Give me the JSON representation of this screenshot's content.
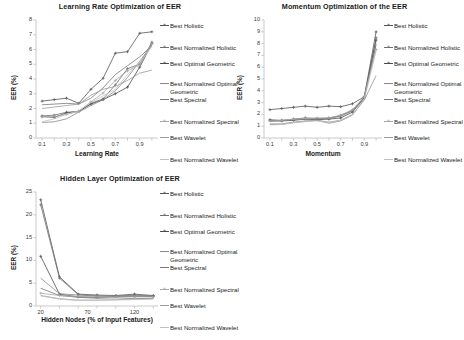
{
  "figure": {
    "background": "#ffffff",
    "series_names": [
      "Best Holistic",
      "Best Normalized Holistic",
      "Best Optimal Geometric",
      "Best Normalized Optimal Geometric",
      "Best Spectral",
      "Best Normalized Spectral",
      "Best Wavelet",
      "Best Normalized Wavelet"
    ],
    "series_colors": [
      "#555555",
      "#6e6e6e",
      "#4a4a4a",
      "#8a8a8a",
      "#777777",
      "#a8a8a8",
      "#9a9a9a",
      "#c0c0c0"
    ],
    "legend_marker_types": [
      "plus",
      "plus",
      "plus",
      "line",
      "line",
      "plus",
      "line",
      "line"
    ]
  },
  "chart_data": [
    {
      "id": "learning-rate",
      "type": "line",
      "title": "Learning Rate Optimization of EER",
      "xlabel": "Learning Rate",
      "ylabel": "EER (%)",
      "x": [
        0.1,
        0.2,
        0.3,
        0.4,
        0.5,
        0.6,
        0.7,
        0.8,
        0.9,
        1.0
      ],
      "xticks": [
        "0.1",
        "0.3",
        "0.5",
        "0.7",
        "0.9"
      ],
      "xtick_values": [
        0.1,
        0.3,
        0.5,
        0.7,
        0.9
      ],
      "yticks": [
        "0",
        "1",
        "2",
        "3",
        "4",
        "5",
        "6",
        "7",
        "8"
      ],
      "ylim": [
        0,
        8
      ],
      "xlim": [
        0.05,
        1.05
      ],
      "grid": false,
      "legend_position": "right",
      "series": [
        {
          "name": "Best Holistic",
          "values": [
            2.5,
            2.6,
            2.7,
            2.35,
            3.3,
            4.05,
            5.75,
            5.85,
            7.1,
            7.2
          ]
        },
        {
          "name": "Best Normalized Holistic",
          "values": [
            1.5,
            1.55,
            1.75,
            1.8,
            2.35,
            2.65,
            3.6,
            4.7,
            5.0,
            6.5
          ]
        },
        {
          "name": "Best Optimal Geometric",
          "values": [
            1.45,
            1.4,
            1.7,
            1.8,
            2.3,
            2.6,
            3.0,
            3.45,
            4.8,
            6.4
          ]
        },
        {
          "name": "Best Normalized Optimal Geometric",
          "values": [
            1.05,
            1.1,
            1.3,
            1.75,
            2.2,
            2.6,
            3.2,
            4.1,
            5.2,
            6.3
          ]
        },
        {
          "name": "Best Spectral",
          "values": [
            2.25,
            2.3,
            2.35,
            2.3,
            2.7,
            3.4,
            4.3,
            4.9,
            5.5,
            6.25
          ]
        },
        {
          "name": "Best Normalized Spectral",
          "values": [
            1.45,
            1.45,
            1.6,
            1.8,
            2.45,
            3.05,
            3.9,
            4.55,
            4.95,
            6.4
          ]
        },
        {
          "name": "Best Wavelet",
          "values": [
            2.0,
            2.1,
            2.2,
            2.3,
            2.9,
            3.3,
            3.5,
            3.9,
            4.4,
            4.6
          ]
        },
        {
          "name": "Best Normalized Wavelet",
          "values": [
            1.1,
            1.3,
            1.6,
            1.85,
            2.4,
            2.85,
            3.3,
            4.3,
            5.1,
            6.2
          ]
        }
      ]
    },
    {
      "id": "momentum",
      "type": "line",
      "title": "Momentum Optimization of the EER",
      "xlabel": "Momentum",
      "ylabel": "EER (%)",
      "x": [
        0.1,
        0.2,
        0.3,
        0.4,
        0.5,
        0.6,
        0.7,
        0.8,
        0.9,
        1.0
      ],
      "xticks": [
        "0.1",
        "0.3",
        "0.5",
        "0.7",
        "0.9"
      ],
      "xtick_values": [
        0.1,
        0.3,
        0.5,
        0.7,
        0.9
      ],
      "yticks": [
        "0",
        "1",
        "2",
        "3",
        "4",
        "5",
        "6",
        "7",
        "8",
        "9",
        "10"
      ],
      "ylim": [
        0,
        10
      ],
      "xlim": [
        0.05,
        1.05
      ],
      "grid": false,
      "legend_position": "right",
      "series": [
        {
          "name": "Best Holistic",
          "values": [
            2.4,
            2.5,
            2.6,
            2.7,
            2.6,
            2.7,
            2.65,
            2.9,
            3.5,
            9.0
          ]
        },
        {
          "name": "Best Normalized Holistic",
          "values": [
            1.55,
            1.5,
            1.6,
            1.7,
            1.65,
            1.7,
            1.9,
            2.35,
            3.45,
            8.5
          ]
        },
        {
          "name": "Best Optimal Geometric",
          "values": [
            1.5,
            1.45,
            1.5,
            1.6,
            1.55,
            1.6,
            1.7,
            2.2,
            3.4,
            8.3
          ]
        },
        {
          "name": "Best Normalized Optimal Geometric",
          "values": [
            1.15,
            1.15,
            1.3,
            1.4,
            1.5,
            1.25,
            1.45,
            1.95,
            3.3,
            8.0
          ]
        },
        {
          "name": "Best Spectral",
          "values": [
            1.4,
            1.45,
            1.55,
            1.6,
            1.6,
            1.65,
            1.85,
            2.3,
            3.45,
            7.9
          ]
        },
        {
          "name": "Best Normalized Spectral",
          "values": [
            1.45,
            1.5,
            1.6,
            1.65,
            1.7,
            1.7,
            1.95,
            2.4,
            3.5,
            7.5
          ]
        },
        {
          "name": "Best Wavelet",
          "values": [
            1.2,
            1.2,
            1.35,
            1.45,
            1.5,
            1.35,
            1.5,
            2.0,
            3.2,
            5.3
          ]
        },
        {
          "name": "Best Normalized Wavelet",
          "values": [
            1.1,
            1.15,
            1.3,
            1.4,
            1.45,
            1.3,
            1.5,
            1.95,
            3.25,
            7.4
          ]
        }
      ]
    },
    {
      "id": "hidden-layer",
      "type": "line",
      "title": "Hidden Layer Optimization of EER",
      "xlabel": "Hidden Nodes (% of Input Features)",
      "ylabel": "EER (%)",
      "x": [
        20,
        40,
        60,
        80,
        100,
        120,
        140
      ],
      "xticks": [
        "20",
        "70",
        "120"
      ],
      "xtick_values": [
        20,
        70,
        120
      ],
      "yticks": [
        "0",
        "5",
        "10",
        "15",
        "20",
        "25"
      ],
      "ylim": [
        0,
        25
      ],
      "xlim": [
        15,
        145
      ],
      "grid": false,
      "legend_position": "right",
      "series": [
        {
          "name": "Best Holistic",
          "values": [
            23.3,
            6.4,
            2.6,
            2.4,
            2.3,
            2.6,
            2.3
          ]
        },
        {
          "name": "Best Normalized Holistic",
          "values": [
            22.2,
            6.1,
            2.5,
            2.2,
            2.2,
            2.4,
            2.2
          ]
        },
        {
          "name": "Best Optimal Geometric",
          "values": [
            10.9,
            2.6,
            2.0,
            1.9,
            2.1,
            2.1,
            2.1
          ]
        },
        {
          "name": "Best Normalized Optimal Geometric",
          "values": [
            6.1,
            2.7,
            2.4,
            2.2,
            2.2,
            2.3,
            2.2
          ]
        },
        {
          "name": "Best Spectral",
          "values": [
            3.9,
            2.3,
            1.9,
            1.7,
            1.8,
            1.6,
            1.7
          ]
        },
        {
          "name": "Best Normalized Spectral",
          "values": [
            2.8,
            2.3,
            2.1,
            2.0,
            2.0,
            2.0,
            2.0
          ]
        },
        {
          "name": "Best Wavelet",
          "values": [
            2.3,
            1.6,
            1.3,
            1.3,
            1.4,
            1.5,
            1.6
          ]
        },
        {
          "name": "Best Normalized Wavelet",
          "values": [
            2.2,
            1.5,
            1.2,
            1.2,
            1.3,
            1.4,
            1.5
          ]
        }
      ]
    }
  ]
}
